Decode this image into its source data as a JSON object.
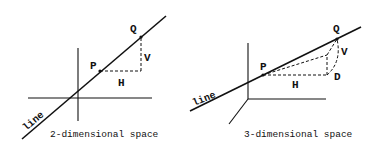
{
  "diagrams": [
    {
      "id": "2d",
      "caption": "2-dimensional space",
      "line_label": "line",
      "points": {
        "P": "P",
        "Q": "Q"
      },
      "segments": {
        "H": "H",
        "V": "V"
      }
    },
    {
      "id": "3d",
      "caption": "3-dimensional space",
      "line_label": "line",
      "points": {
        "P": "P",
        "Q": "Q"
      },
      "segments": {
        "H": "H",
        "V": "V",
        "D": "D"
      }
    }
  ],
  "colors": {
    "stroke": "#111111",
    "background": "#ffffff"
  }
}
